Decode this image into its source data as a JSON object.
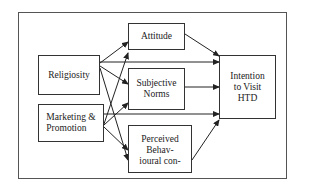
{
  "diagram": {
    "nodes": {
      "religiosity": {
        "label": "Religiosity"
      },
      "marketing": {
        "label": "Marketing  &\nPromotion"
      },
      "attitude": {
        "label": "Attitude"
      },
      "subjective_norms": {
        "label": "Subjective\nNorms"
      },
      "perceived_behavioural": {
        "label": "Perceived\nBehav-\nioural con-"
      },
      "intention": {
        "label": "Intention\nto Visit\nHTD"
      }
    },
    "edges": [
      {
        "from": "religiosity",
        "to": "attitude"
      },
      {
        "from": "religiosity",
        "to": "subjective_norms"
      },
      {
        "from": "religiosity",
        "to": "perceived_behavioural"
      },
      {
        "from": "religiosity",
        "to": "intention"
      },
      {
        "from": "marketing",
        "to": "attitude"
      },
      {
        "from": "marketing",
        "to": "subjective_norms"
      },
      {
        "from": "marketing",
        "to": "perceived_behavioural"
      },
      {
        "from": "marketing",
        "to": "intention"
      },
      {
        "from": "attitude",
        "to": "intention"
      },
      {
        "from": "subjective_norms",
        "to": "intention"
      },
      {
        "from": "perceived_behavioural",
        "to": "intention"
      }
    ]
  }
}
